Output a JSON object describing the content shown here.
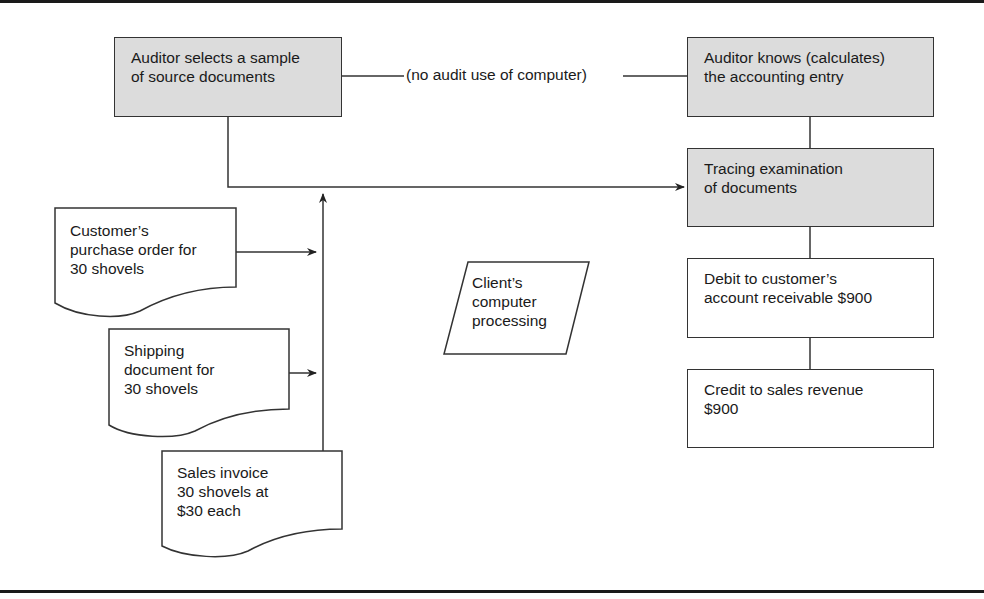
{
  "diagram": {
    "boxes": {
      "auditor_selects": [
        "Auditor selects a sample",
        "of source documents"
      ],
      "auditor_knows": [
        "Auditor knows (calculates)",
        "the accounting entry"
      ],
      "tracing": [
        "Tracing examination",
        "of documents"
      ],
      "debit": [
        "Debit to customer’s",
        "account receivable $900"
      ],
      "credit": [
        "Credit to sales revenue",
        "$900"
      ]
    },
    "connector_label": "(no audit use of computer)",
    "documents": {
      "purchase_order": [
        "Customer’s",
        "purchase order for",
        "30 shovels"
      ],
      "shipping": [
        "Shipping",
        "document for",
        "30 shovels"
      ],
      "invoice": [
        "Sales invoice",
        "30 shovels at",
        "$30 each"
      ]
    },
    "process": [
      "Client’s",
      "computer",
      "processing"
    ],
    "colors": {
      "shaded_box": "#dcdcdc",
      "stroke": "#333333"
    }
  }
}
